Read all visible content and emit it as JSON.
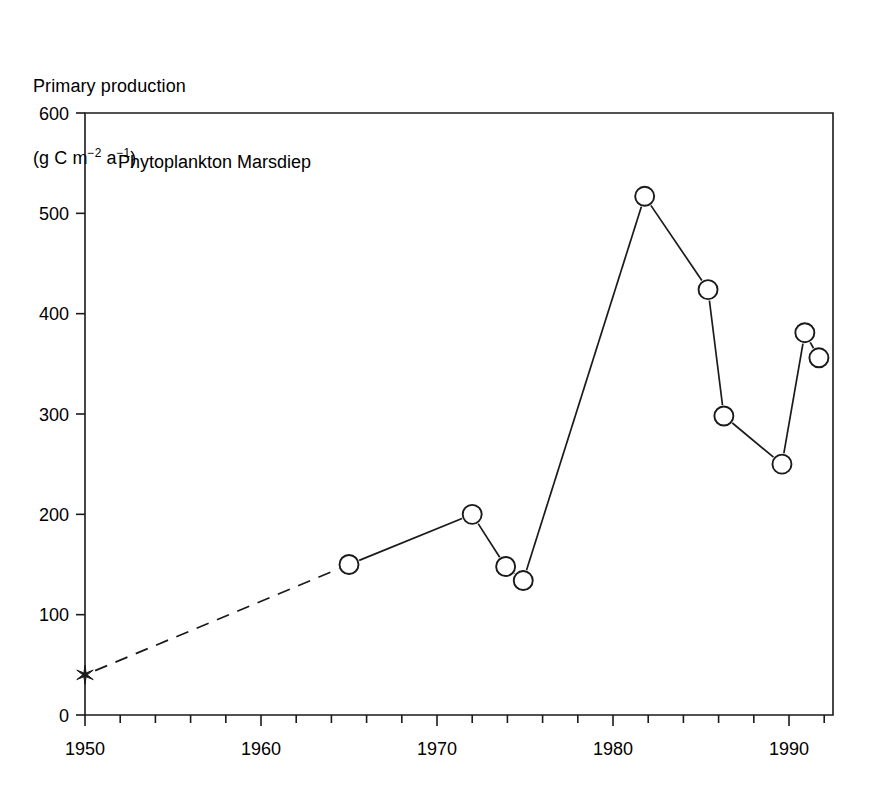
{
  "figure": {
    "y_axis_title_line1": "Primary production",
    "y_axis_title_line2_prefix": "(g C m",
    "y_axis_title_sup1": "−2",
    "y_axis_title_mid": " a",
    "y_axis_title_sup2": "−1",
    "y_axis_title_suffix": ")",
    "annotation": "Phytoplankton Marsdiep",
    "line_color": "#1a1a1a",
    "marker_fill": "#ffffff",
    "background": "#ffffff"
  },
  "chart_data": {
    "type": "line",
    "title": "Phytoplankton Marsdiep",
    "xlabel": "",
    "ylabel": "Primary production (g C m−2 a−1)",
    "xlim": [
      1950,
      1992.5
    ],
    "ylim": [
      0,
      600
    ],
    "xticks": [
      1950,
      1960,
      1970,
      1980,
      1990
    ],
    "xtick_labels": [
      "1950",
      "1960",
      "1970",
      "1980",
      "1990"
    ],
    "xticks_minor_step": 2,
    "yticks": [
      0,
      100,
      200,
      300,
      400,
      500,
      600
    ],
    "ytick_labels": [
      "0",
      "100",
      "200",
      "300",
      "400",
      "500",
      "600"
    ],
    "grid": false,
    "legend": null,
    "series": [
      {
        "name": "Primary production",
        "marker": "circle-open",
        "linestyle_segments": [
          {
            "from_index": 0,
            "to_index": 1,
            "style": "dashed"
          },
          {
            "from_index": 1,
            "to_index": 10,
            "style": "solid"
          }
        ],
        "points": [
          {
            "x": 1950.0,
            "y": 40,
            "marker": "star"
          },
          {
            "x": 1965.0,
            "y": 150,
            "marker": "circle-open"
          },
          {
            "x": 1972.0,
            "y": 200,
            "marker": "circle-open"
          },
          {
            "x": 1973.9,
            "y": 148,
            "marker": "circle-open"
          },
          {
            "x": 1974.9,
            "y": 134,
            "marker": "circle-open"
          },
          {
            "x": 1981.8,
            "y": 517,
            "marker": "circle-open"
          },
          {
            "x": 1985.4,
            "y": 424,
            "marker": "circle-open"
          },
          {
            "x": 1986.3,
            "y": 298,
            "marker": "circle-open"
          },
          {
            "x": 1989.6,
            "y": 250,
            "marker": "circle-open"
          },
          {
            "x": 1990.9,
            "y": 381,
            "marker": "circle-open"
          },
          {
            "x": 1991.7,
            "y": 356,
            "marker": "circle-open"
          }
        ]
      }
    ]
  }
}
